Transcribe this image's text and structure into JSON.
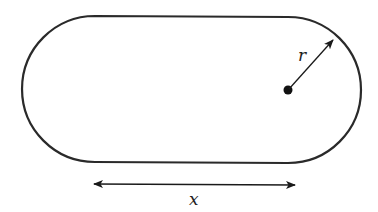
{
  "diagram": {
    "type": "stadium-shape",
    "labels": {
      "radius": "r",
      "length": "x"
    },
    "colors": {
      "stroke": "#2a2a2a",
      "background": "#ffffff"
    }
  }
}
